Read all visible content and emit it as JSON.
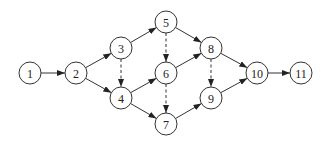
{
  "diagram": {
    "type": "directed-network",
    "node_radius": 11,
    "nodes": [
      {
        "id": "1",
        "label": "1",
        "x": 30,
        "y": 73
      },
      {
        "id": "2",
        "label": "2",
        "x": 76,
        "y": 73
      },
      {
        "id": "3",
        "label": "3",
        "x": 121,
        "y": 48
      },
      {
        "id": "4",
        "label": "4",
        "x": 121,
        "y": 98
      },
      {
        "id": "5",
        "label": "5",
        "x": 166,
        "y": 22
      },
      {
        "id": "6",
        "label": "6",
        "x": 166,
        "y": 73
      },
      {
        "id": "7",
        "label": "7",
        "x": 166,
        "y": 124
      },
      {
        "id": "8",
        "label": "8",
        "x": 211,
        "y": 48
      },
      {
        "id": "9",
        "label": "9",
        "x": 211,
        "y": 98
      },
      {
        "id": "10",
        "label": "10",
        "x": 257,
        "y": 73
      },
      {
        "id": "11",
        "label": "11",
        "x": 301,
        "y": 73
      }
    ],
    "edges": [
      {
        "from": "1",
        "to": "2",
        "style": "solid"
      },
      {
        "from": "2",
        "to": "3",
        "style": "solid"
      },
      {
        "from": "2",
        "to": "4",
        "style": "solid"
      },
      {
        "from": "3",
        "to": "5",
        "style": "solid"
      },
      {
        "from": "3",
        "to": "4",
        "style": "dashed"
      },
      {
        "from": "4",
        "to": "6",
        "style": "solid"
      },
      {
        "from": "4",
        "to": "7",
        "style": "solid"
      },
      {
        "from": "5",
        "to": "6",
        "style": "dashed"
      },
      {
        "from": "5",
        "to": "8",
        "style": "solid"
      },
      {
        "from": "6",
        "to": "8",
        "style": "solid"
      },
      {
        "from": "6",
        "to": "7",
        "style": "dashed"
      },
      {
        "from": "7",
        "to": "9",
        "style": "solid"
      },
      {
        "from": "8",
        "to": "9",
        "style": "dashed"
      },
      {
        "from": "8",
        "to": "10",
        "style": "solid"
      },
      {
        "from": "9",
        "to": "10",
        "style": "solid"
      },
      {
        "from": "10",
        "to": "11",
        "style": "solid"
      }
    ]
  }
}
